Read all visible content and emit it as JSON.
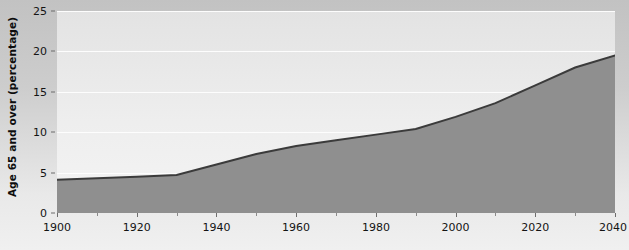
{
  "chart_data": {
    "type": "area",
    "title": "",
    "subtitle": "",
    "xlabel": "",
    "ylabel": "Age 65 and over (percentage)",
    "xlim": [
      1900,
      2040
    ],
    "ylim": [
      0,
      25
    ],
    "grid": true,
    "legend": "none",
    "x_ticks": [
      1900,
      1920,
      1940,
      1960,
      1980,
      2000,
      2020,
      2040
    ],
    "x_minor_ticks": [
      1910,
      1930,
      1950,
      1970,
      1990,
      2010,
      2030
    ],
    "y_ticks": [
      0,
      5,
      10,
      15,
      20,
      25
    ],
    "x": [
      1900,
      1910,
      1920,
      1930,
      1940,
      1950,
      1960,
      1970,
      1980,
      1990,
      2000,
      2010,
      2020,
      2030,
      2040,
      2045
    ],
    "values": [
      4.1,
      4.3,
      4.5,
      4.7,
      6.0,
      7.3,
      8.3,
      9.0,
      9.7,
      10.4,
      11.9,
      13.6,
      15.8,
      18.0,
      19.5,
      19.5
    ],
    "series": [
      {
        "name": "Age 65 and over (percentage)",
        "values": [
          4.1,
          4.3,
          4.5,
          4.7,
          6.0,
          7.3,
          8.3,
          9.0,
          9.7,
          10.4,
          11.9,
          13.6,
          15.8,
          18.0,
          19.5,
          19.5
        ]
      }
    ],
    "colors": {
      "area_fill": "#8f8f8f",
      "line": "#3b3b3b",
      "plot_background": "#ededed",
      "gridline": "#fdfdfd",
      "figure_background": "#c9c9c9",
      "axis_text": "#141414"
    }
  },
  "axis": {
    "y_tick_labels": [
      "0",
      "5",
      "10",
      "15",
      "20",
      "25"
    ],
    "x_tick_labels": [
      "1900",
      "1920",
      "1940",
      "1960",
      "1980",
      "2000",
      "2020",
      "2040"
    ],
    "y_axis_title": "Age 65 and over (percentage)"
  }
}
